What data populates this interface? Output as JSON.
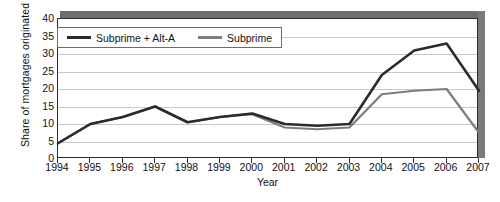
{
  "chart_data": {
    "type": "line",
    "title": "",
    "xlabel": "Year",
    "ylabel": "Share of mortgages originated (percent)",
    "ylabel_line1": "Share of mortgages",
    "ylabel_line2": "originated (percent)",
    "categories": [
      "1994",
      "1995",
      "1996",
      "1997",
      "1998",
      "1999",
      "2000",
      "2001",
      "2002",
      "2003",
      "2004",
      "2005",
      "2006",
      "2007"
    ],
    "x": [
      1994,
      1995,
      1996,
      1997,
      1998,
      1999,
      2000,
      2001,
      2002,
      2003,
      2004,
      2005,
      2006,
      2007
    ],
    "xlim": [
      1994,
      2007
    ],
    "ylim": [
      0,
      40
    ],
    "yticks": [
      0,
      5,
      10,
      15,
      20,
      25,
      30,
      35,
      40
    ],
    "xticks": [
      1994,
      1995,
      1996,
      1997,
      1998,
      1999,
      2000,
      2001,
      2002,
      2003,
      2004,
      2005,
      2006,
      2007
    ],
    "grid": "horizontal",
    "legend_position": "top-left inside",
    "series": [
      {
        "name": "Subprime + Alt-A",
        "color": "#2b2b2b",
        "values": [
          4.5,
          10.0,
          12.0,
          15.0,
          10.5,
          12.0,
          13.0,
          10.0,
          9.5,
          10.0,
          24.0,
          31.0,
          33.0,
          19.5
        ]
      },
      {
        "name": "Subprime",
        "color": "#7d7d7d",
        "values": [
          4.5,
          10.0,
          12.0,
          15.0,
          10.5,
          12.0,
          12.8,
          9.0,
          8.5,
          9.0,
          18.5,
          19.5,
          20.0,
          7.5
        ]
      }
    ]
  },
  "legend": {
    "item1": "Subprime + Alt-A",
    "item2": "Subprime"
  },
  "axis": {
    "y_title_line1": "Share of mortgages",
    "y_title_line2": "originated (percent)",
    "x_title": "Year"
  },
  "colors": {
    "series1": "#2b2b2b",
    "series2": "#7d7d7d",
    "grid": "#c9c9c9",
    "frame": "#2b2b2b",
    "shadow": "#6e6e6e",
    "background": "#ffffff"
  }
}
